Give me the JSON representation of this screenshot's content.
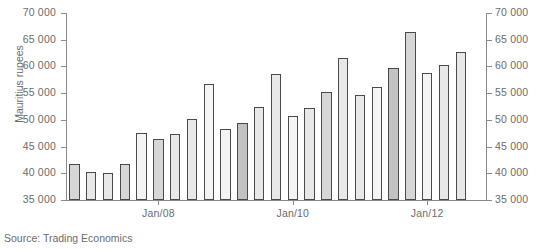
{
  "chart_data": {
    "type": "bar",
    "title": "",
    "xlabel": "",
    "ylabel": "Mauritius rupees",
    "ylim": [
      35000,
      70000
    ],
    "ytick_values": [
      70000,
      65000,
      60000,
      55000,
      50000,
      45000,
      40000,
      35000
    ],
    "ytick_labels_left": [
      "70 000",
      "65 000",
      "60 000",
      "55 000",
      "50 000",
      "45 000",
      "40 000",
      "35 000"
    ],
    "ytick_labels_right": [
      "70 000",
      "65 000",
      "60 000",
      "55 000",
      "50 000",
      "45 000",
      "40 000",
      "35 000"
    ],
    "grid": false,
    "legend": null,
    "xtick_labels": [
      "Jan/08",
      "Jan/10",
      "Jan/12"
    ],
    "xtick_indices": [
      5,
      13,
      21
    ],
    "categories": [
      "Q1",
      "Q2",
      "Q3",
      "Q4",
      "Jan/08",
      "Q2",
      "Q3",
      "Q4",
      "Q1",
      "Q2",
      "Q3",
      "Q4",
      "Q1",
      "Jan/10",
      "Q3",
      "Q4",
      "Q1",
      "Q2",
      "Q3",
      "Q4",
      "Q1",
      "Jan/12",
      "Q3",
      "Q4",
      "Q1"
    ],
    "values": [
      41800,
      40200,
      40000,
      41800,
      47600,
      46400,
      47300,
      50200,
      56700,
      48200,
      49400,
      52400,
      58500,
      50800,
      52200,
      55300,
      61500,
      54600,
      56200,
      59700,
      66500,
      58700,
      60200,
      62700,
      35000
    ],
    "bar_shades": [
      "shade-b",
      "shade-c",
      "shade-c",
      "shade-b",
      "shade-a",
      "shade-b",
      "shade-c",
      "shade-c",
      "shade-a",
      "shade-a",
      "shade-d",
      "shade-c",
      "shade-c",
      "shade-a",
      "shade-c",
      "shade-b",
      "shade-c",
      "shade-c",
      "shade-a",
      "shade-d",
      "shade-b",
      "shade-a",
      "shade-c",
      "shade-c",
      "shade-c"
    ]
  },
  "source": {
    "note": "Source: Trading Economics"
  },
  "axis": {
    "y_title": "Mauritius rupees"
  }
}
